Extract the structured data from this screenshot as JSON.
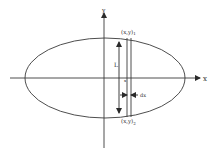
{
  "diagram": {
    "axes": {
      "x_label": "x",
      "y_label": "y"
    },
    "ellipse": {
      "cx": 105,
      "cy": 78,
      "rx": 80,
      "ry": 40
    },
    "strip": {
      "top_label": "(x,y)",
      "top_subscript": "1",
      "bottom_label": "(x,y)",
      "bottom_subscript": "2",
      "length_label": "L",
      "width_label": "dx",
      "position_label": "x"
    },
    "colors": {
      "stroke": "#3a3a3a",
      "background": "#ffffff"
    }
  }
}
